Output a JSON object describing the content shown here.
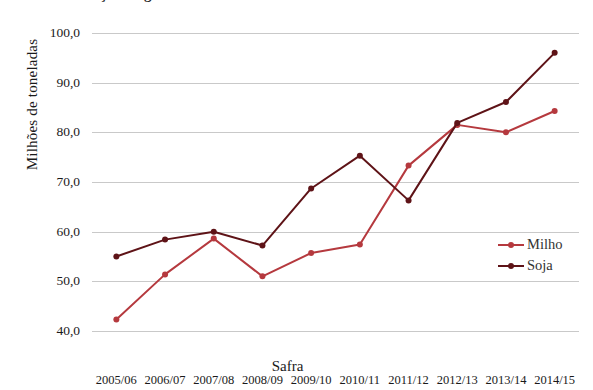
{
  "figure": {
    "clipped_title": "Produção de grãos no Brasil",
    "xlabel": "Safra",
    "ylabel": "Milhões de toneladas"
  },
  "axes": {
    "y_ticks": [
      "100,0",
      "90,0",
      "80,0",
      "70,0",
      "60,0",
      "50,0",
      "40,0"
    ],
    "x_ticks": [
      "2005/06",
      "2006/07",
      "2007/08",
      "2008/09",
      "2009/10",
      "2010/11",
      "2011/12",
      "2012/13",
      "2013/14",
      "2014/15"
    ]
  },
  "legend": {
    "items": [
      {
        "label": "Milho",
        "color": "#b5393e"
      },
      {
        "label": "Soja",
        "color": "#5e1317"
      }
    ]
  },
  "chart_data": {
    "type": "line",
    "title": "",
    "xlabel": "Safra",
    "ylabel": "Milhões de toneladas",
    "categories": [
      "2005/06",
      "2006/07",
      "2007/08",
      "2008/09",
      "2009/10",
      "2010/11",
      "2011/12",
      "2012/13",
      "2013/14",
      "2014/15"
    ],
    "series": [
      {
        "name": "Milho",
        "color": "#b5393e",
        "values": [
          42.3,
          51.4,
          58.6,
          51.0,
          55.7,
          57.4,
          73.3,
          81.5,
          80.0,
          84.3
        ]
      },
      {
        "name": "Soja",
        "color": "#5e1317",
        "values": [
          55.0,
          58.4,
          60.0,
          57.2,
          68.7,
          75.3,
          66.3,
          81.9,
          86.1,
          96.0
        ]
      }
    ],
    "ylim": [
      40.0,
      100.0
    ],
    "ytick_values": [
      100.0,
      90.0,
      80.0,
      70.0,
      60.0,
      50.0,
      40.0
    ],
    "grid": "horizontal",
    "legend_position": "right",
    "markers": true
  }
}
